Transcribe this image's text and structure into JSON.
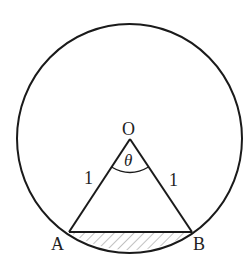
{
  "diagram": {
    "title": "",
    "colors": {
      "stroke": "#1a1a1a",
      "hatch": "#666666",
      "text": "#222222",
      "background": "#ffffff"
    },
    "circle": {
      "cx": 130,
      "cy": 139,
      "r": 113
    },
    "points": {
      "O": {
        "label": "O",
        "x": 130,
        "y": 139
      },
      "A": {
        "label": "A",
        "x": 69,
        "y": 232
      },
      "B": {
        "label": "B",
        "x": 192,
        "y": 232
      }
    },
    "sides": {
      "OA": {
        "label": "1"
      },
      "OB": {
        "label": "1"
      }
    },
    "angle": {
      "label": "θ",
      "at": "O"
    },
    "shaded_region": "segment between chord AB and arc AB"
  }
}
